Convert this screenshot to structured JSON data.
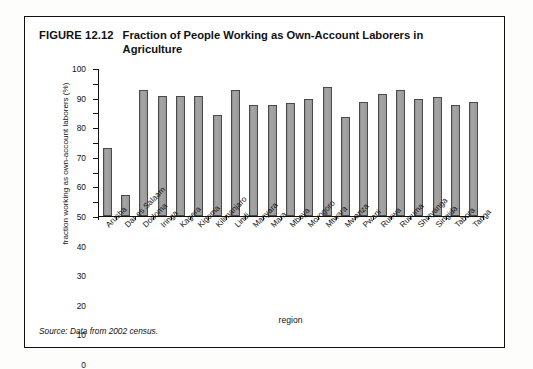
{
  "figure": {
    "number": "FIGURE 12.12",
    "title": "Fraction of People Working as Own-Account Laborers in Agriculture",
    "source": "Source: Data from 2002 census."
  },
  "chart_data": {
    "type": "bar",
    "title": "Fraction of People Working as Own-Account Laborers in Agriculture",
    "xlabel": "region",
    "ylabel": "fraction working as own-account laborers (%)",
    "ylim": [
      0,
      100
    ],
    "ytick_labels": [
      "0",
      "10",
      "20",
      "30",
      "40",
      "50",
      "60",
      "70",
      "80",
      "90",
      "100"
    ],
    "yticks": [
      0,
      10,
      20,
      30,
      40,
      50,
      60,
      70,
      80,
      90,
      100
    ],
    "grid": false,
    "legend": false,
    "bar_color": "#9c9c9c",
    "bar_edge_color": "#4a4a4a",
    "categories": [
      "Arusha",
      "Dar es Salaam",
      "Dodoma",
      "Iringa",
      "Kagera",
      "Kigoma",
      "Kilimanjaro",
      "Lindi",
      "Manyara",
      "Mara",
      "Mbeya",
      "Morogoro",
      "Mtwara",
      "Mwanza",
      "Pwani",
      "Rukwa",
      "Ruvuma",
      "Shinyanga",
      "Singida",
      "Tabora",
      "Tanga"
    ],
    "values": [
      46,
      14,
      85,
      81,
      81,
      81,
      68,
      85,
      75,
      75,
      76,
      79,
      87,
      67,
      77,
      82,
      85,
      79,
      80,
      75,
      77
    ]
  }
}
